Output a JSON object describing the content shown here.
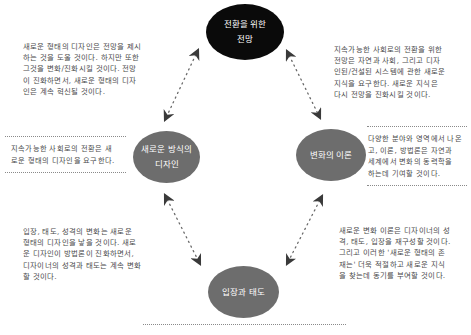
{
  "nodes": {
    "top": {
      "line1": "전환을 위한",
      "line2": "전망",
      "color": "#0a0a0a"
    },
    "left": {
      "line1": "새로운 방식의",
      "line2": "디자인",
      "color": "#6d6d6d"
    },
    "right": {
      "line1": "변화의 이론",
      "color": "#6d6d6d"
    },
    "bottom": {
      "line1": "입장과 태도",
      "color": "#6d6d6d"
    }
  },
  "descriptions": {
    "top_left": [
      "새로운 형태의 디자인은 전망을 제시",
      "하는 것을 도울 것이다. 하지만 또한",
      "그것을 변화/진화시킬 것이다. 전망",
      "이 진화하면서, 새로운 형태의 디자",
      "인은 계속 혁신될 것이다."
    ],
    "top_right": [
      "지속가능한 사회로의 전환을 위한",
      "전망은 자연과 사회, 그리고 디자",
      "인된/건설된 시스템에 관한 새로운",
      "지식을 요구한다. 새로운 지식은",
      "다시 전망을 진화시킬 것이다."
    ],
    "left": [
      "지속가능한 사회로의 전환은 새",
      "로운 형태의 디자인을 요구한다."
    ],
    "right": [
      "다양한 분야와 영역에서 나온",
      "고, 이론, 방법론은 자연과",
      "세계에서 변화의 동력학을",
      "하는데 기여할 것이다."
    ],
    "bottom_left": [
      "입장, 태도, 성격의 변화는 새로운",
      "형태의 디자인을 낳을 것이다. 새로",
      "운 디자인이 방법론이 진화하면서,",
      "디자이너의 성격과 태도는 계속 변화",
      "할 것이다."
    ],
    "bottom_right": [
      "새로운 변화 이론은 디자이너의 성",
      "격, 태도, 입장을 재구성할 것이다.",
      "그리고 이러한 '새로운 형태의 존",
      "재는' 더욱 적절하고 새로운 지식",
      "을 찾는데 동기를 부여할 것이다."
    ]
  },
  "colors": {
    "arrow": "#3a3a3a",
    "dotted_rule": "#8a8a8a",
    "text": "#4a4a4a"
  }
}
